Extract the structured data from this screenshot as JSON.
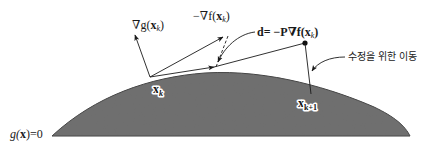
{
  "diagram": {
    "type": "projected gradient method correction step",
    "colors": {
      "surface_fill": "#727272",
      "surface_edge": "#3c3c3c",
      "line": "#1a1a1a",
      "background": "#ffffff"
    },
    "labels": {
      "grad_g": {
        "prefix": "∇g(",
        "var": "x",
        "sub": "k",
        "suffix": ")"
      },
      "neg_grad_f": {
        "prefix": "−∇f(",
        "var": "x",
        "sub": "k",
        "suffix": ")"
      },
      "direction": {
        "prefix": "d= −P∇f(",
        "var": "x",
        "sub": "k",
        "suffix": ")"
      },
      "correction_move": "수정을 위한 이동",
      "point_xk": {
        "var": "x",
        "sub": "k"
      },
      "point_xk1": {
        "var": "x",
        "sub": "k+1"
      },
      "constraint": {
        "prefix": "g(",
        "var": "x",
        "suffix": ")=0"
      }
    },
    "points": {
      "xk": [
        150,
        77
      ],
      "xk1": [
        300,
        91
      ],
      "projected_end": [
        305,
        43
      ],
      "neg_grad_f_tip": [
        225,
        35
      ],
      "grad_g_tip": [
        134,
        33
      ]
    }
  }
}
